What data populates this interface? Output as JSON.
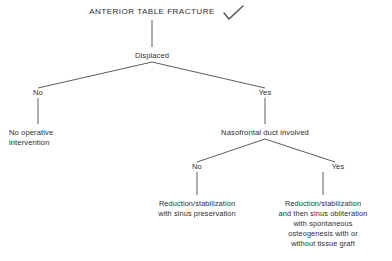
{
  "diagram": {
    "title": "ANTERIOR TABLE FRACTURE",
    "annotation_icon": "check-mark-icon",
    "nodes": {
      "root": "ANTERIOR TABLE FRACTURE",
      "displaced": "Displaced",
      "displaced_no": "No",
      "displaced_yes": "Yes",
      "no_operative_line1": "No operative",
      "no_operative_line2": "intervention",
      "nasofrontal": "Nasofrontal duct involved",
      "nasofrontal_no": "No",
      "nasofrontal_yes": "Yes",
      "outcome_left_line1": "Reduction/stabilization",
      "outcome_left_line2": "with sinus preservation",
      "outcome_right_line1": "Reduction/stabilization",
      "outcome_right_line2": "and then sinus obliteration",
      "outcome_right_line3": "with spontaneous",
      "outcome_right_line4": "osteogenesis with or",
      "outcome_right_line5": "without tissue graft"
    },
    "colors": {
      "text": "#2e2e2e",
      "line": "#4a4a4a",
      "background": "#ffffff",
      "check": "#555555"
    }
  }
}
